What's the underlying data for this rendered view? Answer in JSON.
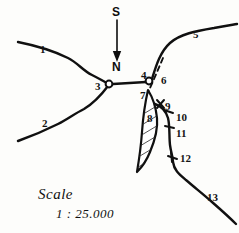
{
  "figure": {
    "kind": "hand-drawn sketch map",
    "background_color": "#fdfdfb",
    "ink_color": "#101010",
    "width": 239,
    "height": 233
  },
  "compass": {
    "top_label": "S",
    "bottom_label": "N",
    "arrow_direction": "down"
  },
  "scale": {
    "word": "Scale",
    "ratio": "1 : 25.000"
  },
  "labels": [
    {
      "id": "1",
      "text": "1",
      "x": 40,
      "y": 44
    },
    {
      "id": "2",
      "text": "2",
      "x": 42,
      "y": 118
    },
    {
      "id": "3",
      "text": "3",
      "x": 95,
      "y": 81
    },
    {
      "id": "4",
      "text": "4",
      "x": 141,
      "y": 70
    },
    {
      "id": "5",
      "text": "5",
      "x": 193,
      "y": 29
    },
    {
      "id": "6",
      "text": "6",
      "x": 161,
      "y": 75
    },
    {
      "id": "7",
      "text": "7",
      "x": 140,
      "y": 90
    },
    {
      "id": "8",
      "text": "8",
      "x": 147,
      "y": 113
    },
    {
      "id": "9",
      "text": "9",
      "x": 165,
      "y": 101
    },
    {
      "id": "10",
      "text": "10",
      "x": 176,
      "y": 112
    },
    {
      "id": "11",
      "text": "11",
      "x": 176,
      "y": 128
    },
    {
      "id": "12",
      "text": "12",
      "x": 180,
      "y": 153
    },
    {
      "id": "13",
      "text": "13",
      "x": 207,
      "y": 192
    }
  ],
  "features": {
    "nodes": [
      {
        "name": "west-junction-node",
        "x": 109,
        "y": 84
      },
      {
        "name": "east-junction-node",
        "x": 150,
        "y": 81
      }
    ],
    "hatched_body_label": "8",
    "dashed_line_label": "6",
    "tick_marks": 4
  }
}
